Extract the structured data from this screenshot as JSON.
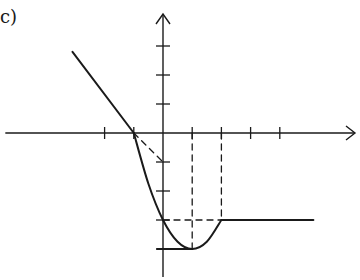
{
  "label": "c)",
  "chart_data": {
    "type": "line",
    "title": "",
    "xlabel": "",
    "ylabel": "",
    "xlim": [
      -5.4,
      6.6
    ],
    "ylim": [
      -4.9,
      4.1
    ],
    "x_ticks": [
      -2,
      -1,
      1,
      2,
      3,
      4
    ],
    "y_ticks": [
      3,
      2,
      1,
      -1,
      -2,
      -3,
      -4
    ],
    "grid": false,
    "color": "#1a1a1a",
    "series": [
      {
        "name": "f-linear-left",
        "style": "solid",
        "points": [
          [
            -3.1,
            2.8
          ],
          [
            -1,
            0
          ]
        ]
      },
      {
        "name": "f-curve",
        "style": "solid",
        "points": [
          [
            -1,
            0
          ],
          [
            -0.5,
            -1.75
          ],
          [
            0,
            -3
          ],
          [
            0.5,
            -3.75
          ],
          [
            1,
            -4
          ],
          [
            1.5,
            -3.75
          ],
          [
            2,
            -3
          ]
        ]
      },
      {
        "name": "f-constant-right",
        "style": "solid",
        "points": [
          [
            2,
            -3
          ],
          [
            5.15,
            -3
          ]
        ]
      },
      {
        "name": "tangent-at-minus-1",
        "style": "dashed",
        "points": [
          [
            -1,
            0
          ],
          [
            0,
            -1
          ]
        ]
      },
      {
        "name": "guide-x1",
        "style": "dashed",
        "points": [
          [
            1,
            0
          ],
          [
            1,
            -4
          ]
        ]
      },
      {
        "name": "guide-x2",
        "style": "dashed",
        "points": [
          [
            2,
            0
          ],
          [
            2,
            -3
          ]
        ]
      },
      {
        "name": "guide-y-minus3",
        "style": "dashed",
        "points": [
          [
            0,
            -3
          ],
          [
            2,
            -3
          ]
        ]
      },
      {
        "name": "guide-y-minus4",
        "style": "solid",
        "points": [
          [
            -0.2,
            -4
          ],
          [
            1,
            -4
          ]
        ]
      }
    ]
  }
}
